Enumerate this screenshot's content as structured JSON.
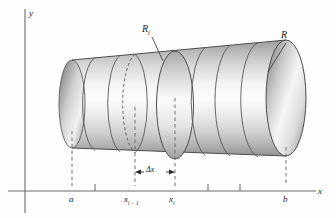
{
  "figure": {
    "background_color": "#fefefe",
    "ink_color": "#1a1a1a",
    "axis_color": "#555555",
    "solid_color_light": "#fafafa",
    "solid_color_dark": "#8e8e8e",
    "solid_edge_color": "#4a4a4a",
    "dash_color": "#5a5a5a"
  },
  "axes": {
    "y_axis_label": "y",
    "x_axis_label": "x",
    "x_axis_y_px": 191,
    "y_axis_x_px": 25,
    "x_axis_end_px": 316,
    "ticks_px": [
      95,
      208,
      240
    ],
    "tick_height_px": 7
  },
  "points": [
    {
      "name": "a",
      "label": "a",
      "sub": "",
      "x_px": 72,
      "dash_top_px": 131,
      "label_x_px": 69,
      "label_y_px": 194
    },
    {
      "name": "x-i-1",
      "label": "x",
      "sub": "i − 1",
      "x_px": 135,
      "dash_top_px": 107,
      "label_x_px": 124,
      "label_y_px": 194
    },
    {
      "name": "x-i",
      "label": "x",
      "sub": "i",
      "x_px": 175,
      "dash_top_px": 98,
      "label_x_px": 169,
      "label_y_px": 194
    },
    {
      "name": "b",
      "label": "b",
      "sub": "",
      "x_px": 286,
      "dash_top_px": 147,
      "label_x_px": 283,
      "label_y_px": 194
    }
  ],
  "delta_annotation": {
    "label": "Δx",
    "from_x_px": 135,
    "to_x_px": 175,
    "y_px": 172,
    "label_x_px": 146,
    "label_y_px": 166
  },
  "radius_labels": [
    {
      "name": "R-i",
      "label": "R",
      "sub": "i",
      "label_x_px": 142,
      "label_y_px": 24,
      "leader_from": [
        152,
        37
      ],
      "leader_to": [
        163,
        61
      ]
    },
    {
      "name": "R",
      "label": "R",
      "sub": "",
      "label_x_px": 281,
      "label_y_px": 30,
      "leader_from": [
        286,
        43
      ],
      "leader_to": [
        268,
        72
      ]
    }
  ],
  "solid": {
    "type": "cone-frustum",
    "description": "tapered cylinder sliced into rings, narrow left end, wide right end",
    "left_center": [
      72,
      104
    ],
    "left_rx": 13,
    "left_ry": 44,
    "right_center": [
      286,
      98
    ],
    "right_rx": 20,
    "right_ry": 58,
    "slice_x_px": [
      95,
      120,
      135,
      160,
      175,
      205,
      230,
      258
    ],
    "dashed_slice_x_px": [
      135
    ],
    "highlighted_slice_x_px": [
      175
    ]
  }
}
